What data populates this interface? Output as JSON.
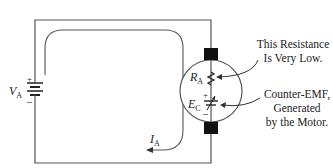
{
  "diagram": {
    "type": "dc-motor-armature-circuit",
    "source": {
      "symbol": "V",
      "subscript": "A",
      "plus": "+",
      "minus": "–"
    },
    "current": {
      "symbol": "I",
      "subscript": "A"
    },
    "resistance": {
      "symbol": "R",
      "subscript": "A"
    },
    "counter_emf": {
      "symbol": "E",
      "subscript": "C",
      "plus": "+",
      "minus": "–"
    },
    "annotations": {
      "resistance_note": [
        "This Resistance",
        "Is Very Low."
      ],
      "emf_note": [
        "Counter-EMF,",
        "Generated",
        "by the Motor."
      ]
    },
    "colors": {
      "wire": "#555555",
      "brush": "#111111",
      "current_path": "#555555"
    }
  }
}
